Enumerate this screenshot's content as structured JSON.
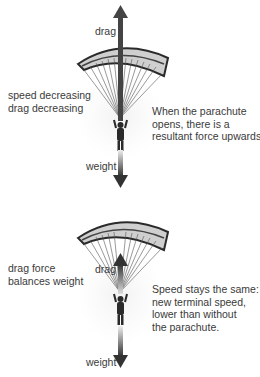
{
  "panel_top": {
    "up_arrow_label": "drag",
    "down_arrow_label": "weight",
    "left_text": [
      "speed decreasing",
      "drag decreasing"
    ],
    "right_text": [
      "When the parachute",
      "opens, there is a",
      "resultant force upwards."
    ]
  },
  "panel_bottom": {
    "up_arrow_label": "drag",
    "down_arrow_label": "weight",
    "left_text": [
      "drag force",
      "balances weight"
    ],
    "right_text": [
      "Speed stays the same:",
      "new terminal speed,",
      "lower than without",
      "the parachute."
    ]
  },
  "colors": {
    "canopy_light": "#d8d8d8",
    "canopy_dark": "#3a3a3a",
    "arrow": "#444444",
    "glow": "#efefef",
    "text": "#3a3a3a"
  }
}
